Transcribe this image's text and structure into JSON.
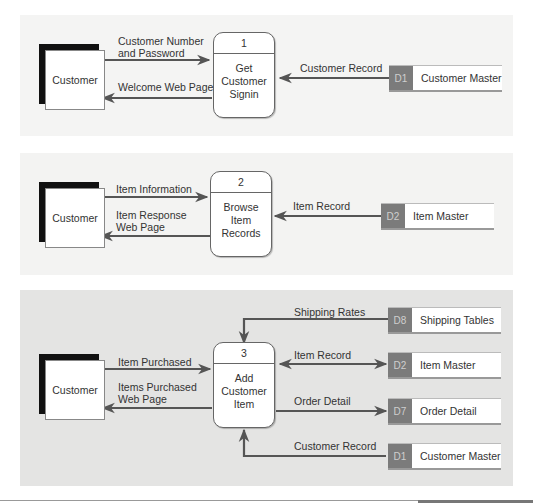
{
  "diagram": {
    "type": "data-flow-diagram",
    "panels": [
      {
        "entity": "Customer",
        "process": {
          "number": "1",
          "label": "Get Customer Signin",
          "lines": [
            "Get",
            "Customer",
            "Signin"
          ]
        },
        "flows_entity": [
          {
            "label": "Customer Number and Password",
            "lines": [
              "Customer Number",
              "and Password"
            ],
            "direction": "to-process"
          },
          {
            "label": "Welcome Web Page",
            "lines": [
              "Welcome Web Page"
            ],
            "direction": "to-entity"
          }
        ],
        "stores": [
          {
            "id": "D1",
            "name": "Customer Master",
            "flow": "Customer Record",
            "direction": "to-process"
          }
        ]
      },
      {
        "entity": "Customer",
        "process": {
          "number": "2",
          "label": "Browse Item Records",
          "lines": [
            "Browse",
            "Item",
            "Records"
          ]
        },
        "flows_entity": [
          {
            "label": "Item Information",
            "lines": [
              "Item Information"
            ],
            "direction": "to-process"
          },
          {
            "label": "Item Response Web Page",
            "lines": [
              "Item Response",
              "Web Page"
            ],
            "direction": "to-entity"
          }
        ],
        "stores": [
          {
            "id": "D2",
            "name": "Item Master",
            "flow": "Item Record",
            "direction": "to-process"
          }
        ]
      },
      {
        "entity": "Customer",
        "process": {
          "number": "3",
          "label": "Add Customer Item",
          "lines": [
            "Add",
            "Customer",
            "Item"
          ]
        },
        "flows_entity": [
          {
            "label": "Item Purchased",
            "lines": [
              "Item Purchased"
            ],
            "direction": "to-process"
          },
          {
            "label": "Items Purchased Web Page",
            "lines": [
              "Items Purchased",
              "Web Page"
            ],
            "direction": "to-entity"
          }
        ],
        "stores": [
          {
            "id": "D8",
            "name": "Shipping Tables",
            "flow": "Shipping Rates",
            "direction": "to-process"
          },
          {
            "id": "D2",
            "name": "Item Master",
            "flow": "Item Record",
            "direction": "bidirectional"
          },
          {
            "id": "D7",
            "name": "Order Detail",
            "flow": "Order Detail",
            "direction": "to-store"
          },
          {
            "id": "D1",
            "name": "Customer Master",
            "flow": "Customer Record",
            "direction": "bidirectional"
          }
        ]
      }
    ]
  },
  "colors": {
    "panel_light": "#f4f4f3",
    "panel_dark": "#e4e4e3",
    "arrow": "#555555",
    "store_id_bg": "#7b7b7b",
    "entity_shadow": "#111111"
  }
}
